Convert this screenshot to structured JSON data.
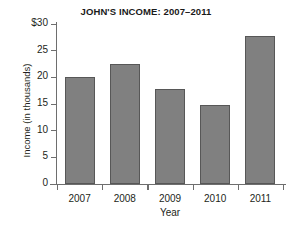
{
  "chart_data": {
    "type": "bar",
    "title": "JOHN'S INCOME: 2007–2011",
    "xlabel": "Year",
    "ylabel": "Income  (in thousands)",
    "categories": [
      "2007",
      "2008",
      "2009",
      "2010",
      "2011"
    ],
    "values": [
      20.0,
      22.5,
      17.8,
      14.8,
      27.8
    ],
    "ylim": [
      0,
      30
    ],
    "yticks": [
      0,
      5,
      10,
      15,
      20,
      25,
      30
    ],
    "ytick_labels": [
      "0",
      "5",
      "10",
      "15",
      "20",
      "25",
      "$30"
    ],
    "grid": false,
    "legend": null,
    "bar_color": "#808080",
    "bar_edge_color": "#575757",
    "axis_color": "#6e6e6e",
    "background": "#ffffff"
  }
}
